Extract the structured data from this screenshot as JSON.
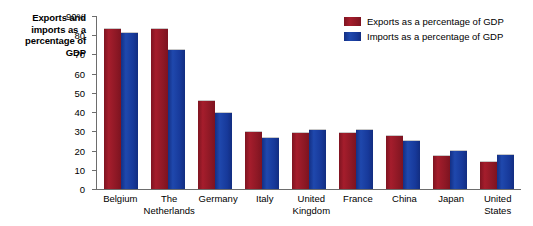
{
  "chart_data": {
    "type": "bar",
    "title": "",
    "xlabel": "",
    "ylabel": "Exports and imports as a percentage of GDP",
    "ylim": [
      0,
      90
    ],
    "yticks": [
      0,
      10,
      20,
      30,
      40,
      50,
      60,
      70,
      80,
      90
    ],
    "ytick_labels": [
      "0",
      "10",
      "20",
      "30",
      "40",
      "50",
      "60",
      "70",
      "80",
      "90%"
    ],
    "grid": false,
    "legend_position": "top-right",
    "categories": [
      "Belgium",
      "The Netherlands",
      "Germany",
      "Italy",
      "United Kingdom",
      "France",
      "China",
      "Japan",
      "United States"
    ],
    "series": [
      {
        "name": "Exports as a percentage of GDP",
        "color": "#9E1B28",
        "values": [
          83,
          83,
          46,
          29.5,
          29,
          29,
          27.5,
          17,
          14
        ]
      },
      {
        "name": "Imports as a percentage of GDP",
        "color": "#1A3FA0",
        "values": [
          81,
          72.5,
          39.5,
          26.5,
          30.5,
          30.5,
          25,
          20,
          17.5
        ]
      }
    ]
  },
  "axis_title": {
    "line1": "Exports and",
    "line2": "imports as a",
    "line3": "percentage of",
    "line4": "GDP"
  },
  "y_axis": {
    "labels": [
      "90%",
      "80",
      "70",
      "60",
      "50",
      "40",
      "30",
      "20",
      "10",
      "0"
    ]
  },
  "x_axis": {
    "categories": [
      {
        "line1": "Belgium",
        "line2": ""
      },
      {
        "line1": "The",
        "line2": "Netherlands"
      },
      {
        "line1": "Germany",
        "line2": ""
      },
      {
        "line1": "Italy",
        "line2": ""
      },
      {
        "line1": "United",
        "line2": "Kingdom"
      },
      {
        "line1": "France",
        "line2": ""
      },
      {
        "line1": "China",
        "line2": ""
      },
      {
        "line1": "Japan",
        "line2": ""
      },
      {
        "line1": "United",
        "line2": "States"
      }
    ]
  },
  "legend": {
    "items": [
      {
        "label": "Exports as a percentage of GDP",
        "color": "#9E1B28"
      },
      {
        "label": "Imports as a percentage of GDP",
        "color": "#1A3FA0"
      }
    ]
  }
}
